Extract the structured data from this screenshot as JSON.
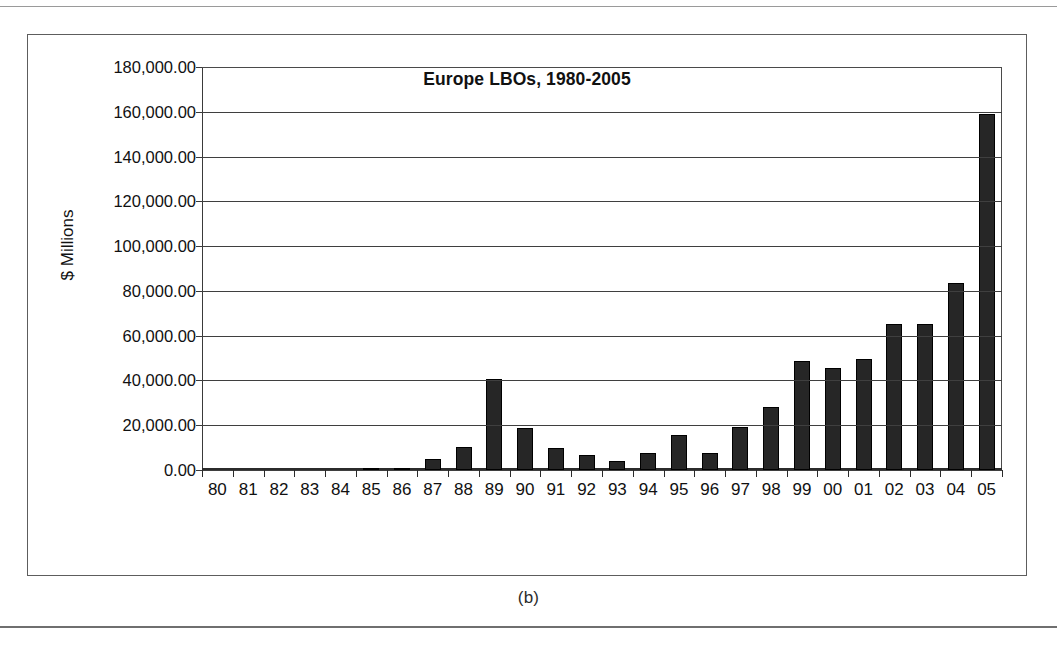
{
  "figure": {
    "caption": "(b)"
  },
  "chart_data": {
    "type": "bar",
    "title": "Europe LBOs, 1980-2005",
    "xlabel": "",
    "ylabel": "$ Millions",
    "ylim": [
      0,
      180000
    ],
    "ytick_step": 20000,
    "grid": true,
    "legend": "none",
    "bar_color": "#262626",
    "categories": [
      "80",
      "81",
      "82",
      "83",
      "84",
      "85",
      "86",
      "87",
      "88",
      "89",
      "90",
      "91",
      "92",
      "93",
      "94",
      "95",
      "96",
      "97",
      "98",
      "99",
      "00",
      "01",
      "02",
      "03",
      "04",
      "05"
    ],
    "ytick_labels": [
      "0.00",
      "20,000.00",
      "40,000.00",
      "60,000.00",
      "80,000.00",
      "100,000.00",
      "120,000.00",
      "140,000.00",
      "160,000.00",
      "180,000.00"
    ],
    "ytick_values": [
      0,
      20000,
      40000,
      60000,
      80000,
      100000,
      120000,
      140000,
      160000,
      180000
    ],
    "values": [
      0,
      0,
      0,
      0,
      0,
      600,
      800,
      4900,
      10300,
      40600,
      18700,
      9800,
      6700,
      4000,
      7600,
      15800,
      7400,
      19200,
      28000,
      48700,
      45400,
      49800,
      65200,
      65400,
      83600,
      159000
    ],
    "series": [
      {
        "name": "Europe LBOs",
        "values": [
          0,
          0,
          0,
          0,
          0,
          600,
          800,
          4900,
          10300,
          40600,
          18700,
          9800,
          6700,
          4000,
          7600,
          15800,
          7400,
          19200,
          28000,
          48700,
          45400,
          49800,
          65200,
          65400,
          83600,
          159000
        ]
      }
    ]
  }
}
